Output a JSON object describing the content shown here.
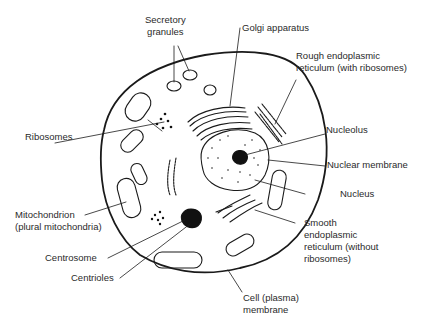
{
  "diagram": {
    "title": "",
    "labels": {
      "secretory_granules": "Secretory\ngranules",
      "golgi_apparatus": "Golgi apparatus",
      "rough_er": "Rough endoplasmic\nreticulum (with ribosomes)",
      "ribosomes": "Ribosomes",
      "nucleolus": "Nucleolus",
      "nuclear_membrane": "Nuclear membrane",
      "nucleus": "Nucleus",
      "mitochondrion": "Mitochondrion\n(plural mitochondria)",
      "smooth_er": "Smooth\nendoplasmic\nreticulum (without\nribosomes)",
      "centrosome": "Centrosome",
      "centrioles": "Centrioles",
      "cell_membrane": "Cell (plasma)\nmembrane"
    },
    "colors": {
      "line": "#1a1a1a",
      "text": "#2a2a2a",
      "background": "#ffffff"
    }
  }
}
